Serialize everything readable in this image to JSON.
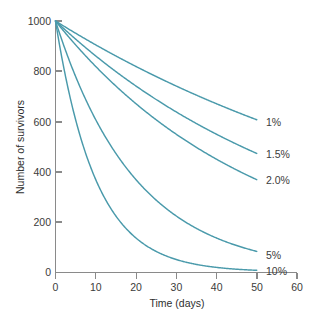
{
  "chart_data": {
    "type": "line",
    "title": "",
    "xlabel": "Time (days)",
    "ylabel": "Number of survivors",
    "xlim": [
      0,
      60
    ],
    "ylim": [
      0,
      1000
    ],
    "xticks": [
      0,
      10,
      20,
      30,
      40,
      50,
      60
    ],
    "yticks": [
      0,
      200,
      400,
      600,
      800,
      1000
    ],
    "xtick_labels": [
      "0",
      "10",
      "20",
      "30",
      "40",
      "50",
      "60"
    ],
    "ytick_labels": [
      "0",
      "200",
      "400",
      "600",
      "800",
      "1000"
    ],
    "grid": false,
    "legend_position": "right-of-curve-endpoints",
    "curve_color": "#4a9aab",
    "axis_color": "#8a8a8a",
    "text_color": "#3b3b3b",
    "initial_population": 1000,
    "x": [
      0,
      5,
      10,
      15,
      20,
      25,
      30,
      35,
      40,
      45,
      50
    ],
    "series": [
      {
        "name": "1%",
        "label": "1%",
        "death_rate_per_day": 0.01,
        "values": [
          1000,
          951,
          905,
          861,
          819,
          779,
          741,
          705,
          670,
          638,
          607
        ]
      },
      {
        "name": "1.5%",
        "label": "1.5%",
        "death_rate_per_day": 0.015,
        "values": [
          1000,
          928,
          861,
          799,
          741,
          687,
          638,
          592,
          549,
          509,
          472
        ]
      },
      {
        "name": "2.0%",
        "label": "2.0%",
        "death_rate_per_day": 0.02,
        "values": [
          1000,
          905,
          819,
          741,
          670,
          607,
          549,
          497,
          449,
          407,
          368
        ]
      },
      {
        "name": "5%",
        "label": "5%",
        "death_rate_per_day": 0.05,
        "values": [
          1000,
          779,
          607,
          472,
          368,
          287,
          223,
          174,
          135,
          105,
          82
        ]
      },
      {
        "name": "10%",
        "label": "10%",
        "death_rate_per_day": 0.1,
        "values": [
          1000,
          607,
          368,
          223,
          135,
          82,
          50,
          30,
          18,
          11,
          7
        ]
      }
    ]
  }
}
